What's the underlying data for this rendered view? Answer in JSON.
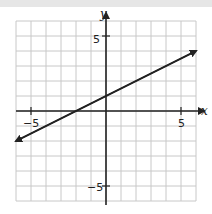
{
  "chart_data": {
    "type": "line",
    "title": "",
    "xlabel": "x",
    "ylabel": "y",
    "xlim": [
      -6,
      6
    ],
    "ylim": [
      -6,
      6
    ],
    "grid": true,
    "x_tick_labels": [
      "-5",
      "5"
    ],
    "y_tick_labels": [
      "5",
      "-5"
    ],
    "series": [
      {
        "name": "line",
        "equation": "y = 0.5x + 1",
        "points": [
          [
            -6,
            -2
          ],
          [
            -2,
            0
          ],
          [
            0,
            1
          ],
          [
            6,
            4
          ]
        ],
        "arrows": "both"
      }
    ]
  },
  "labels": {
    "x_axis": "x",
    "y_axis": "y",
    "x_neg": "−5",
    "x_pos": "5",
    "y_pos": "5",
    "y_neg": "−5"
  }
}
